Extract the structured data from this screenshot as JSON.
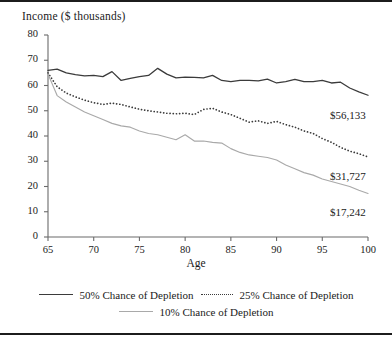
{
  "figure": {
    "axis_title": "Income ($ thousands)",
    "x_axis_label": "Age"
  },
  "ticks": {
    "y": [
      "0",
      "10",
      "20",
      "30",
      "40",
      "50",
      "60",
      "70",
      "80"
    ],
    "x": [
      "65",
      "70",
      "75",
      "80",
      "85",
      "90",
      "95",
      "100"
    ]
  },
  "endpoint_labels": {
    "series50": "$56,133",
    "series25": "$31,727",
    "series10": "$17,242"
  },
  "legend": {
    "row1": [
      {
        "label": "50% Chance of Depletion",
        "style": "solid-dark"
      },
      {
        "label": "25% Chance of Depletion",
        "style": "dotted"
      }
    ],
    "row2": [
      {
        "label": "10% Chance of Depletion",
        "style": "solid-light"
      }
    ]
  },
  "colors": {
    "series50": "#3b3b3b",
    "series25": "#3b3b3b",
    "series10": "#a9a9a9",
    "axis": "#6b6b6b",
    "border": "#1c1c1c",
    "background": "#ffffff"
  },
  "chart_data": {
    "type": "line",
    "title": "Income ($ thousands)",
    "xlabel": "Age",
    "ylabel": "Income ($ thousands)",
    "xlim": [
      65,
      100
    ],
    "ylim": [
      0,
      80
    ],
    "grid": false,
    "legend_position": "below-plot",
    "x": [
      65,
      66,
      67,
      68,
      69,
      70,
      71,
      72,
      73,
      74,
      75,
      76,
      77,
      78,
      79,
      80,
      81,
      82,
      83,
      84,
      85,
      86,
      87,
      88,
      89,
      90,
      91,
      92,
      93,
      94,
      95,
      96,
      97,
      98,
      99,
      100
    ],
    "series": [
      {
        "name": "50% Chance of Depletion",
        "style": "solid",
        "color": "#3b3b3b",
        "end_label": "$56,133",
        "values": [
          66.0,
          66.5,
          65.0,
          64.3,
          63.8,
          64.0,
          63.5,
          65.5,
          62.0,
          62.8,
          63.5,
          64.0,
          66.8,
          64.5,
          63.0,
          63.3,
          63.2,
          63.0,
          64.0,
          62.0,
          61.5,
          62.0,
          62.0,
          61.8,
          62.5,
          61.0,
          61.5,
          62.4,
          61.5,
          61.5,
          62.0,
          61.0,
          61.3,
          59.0,
          57.5,
          56.133
        ]
      },
      {
        "name": "25% Chance of Depletion",
        "style": "dotted",
        "color": "#3b3b3b",
        "end_label": "$31,727",
        "values": [
          65.0,
          59.5,
          57.0,
          55.5,
          54.2,
          53.2,
          52.5,
          53.0,
          52.5,
          51.5,
          50.6,
          50.0,
          49.5,
          49.0,
          48.8,
          49.0,
          48.5,
          50.5,
          51.0,
          49.5,
          48.5,
          47.0,
          45.5,
          46.0,
          45.0,
          45.8,
          44.5,
          43.5,
          42.0,
          41.0,
          39.0,
          37.5,
          35.5,
          34.0,
          33.0,
          31.727
        ]
      },
      {
        "name": "10% Chance of Depletion",
        "style": "solid",
        "color": "#a9a9a9",
        "end_label": "$17,242",
        "values": [
          64.5,
          56.0,
          53.5,
          51.5,
          49.5,
          48.0,
          46.5,
          45.0,
          44.0,
          43.5,
          42.0,
          41.0,
          40.5,
          39.5,
          38.5,
          40.5,
          38.0,
          38.0,
          37.5,
          37.2,
          35.0,
          33.5,
          32.5,
          32.0,
          31.5,
          30.5,
          28.5,
          27.0,
          25.5,
          24.5,
          23.0,
          22.0,
          21.0,
          20.0,
          18.5,
          17.242
        ]
      }
    ]
  }
}
